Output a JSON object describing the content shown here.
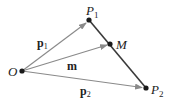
{
  "diagram": {
    "points": {
      "O": {
        "label": "O",
        "x": 22,
        "y": 71
      },
      "P1": {
        "label": "P",
        "sub": "1",
        "x": 89,
        "y": 20
      },
      "M": {
        "label": "M",
        "x": 110,
        "y": 44
      },
      "P2": {
        "label": "P",
        "sub": "2",
        "x": 146,
        "y": 88
      }
    },
    "vectors": [
      {
        "name": "p1",
        "label": "p",
        "sub": "1",
        "from": "O",
        "to": "P1"
      },
      {
        "name": "m",
        "label": "m",
        "from": "O",
        "to": "M"
      },
      {
        "name": "p2",
        "label": "p",
        "sub": "2",
        "from": "O",
        "to": "P2"
      }
    ],
    "segments": [
      {
        "from": "P1",
        "to": "P2"
      }
    ],
    "colors": {
      "vector": "#8a8a8a",
      "segment": "#3a3a3a",
      "point": "#1a1a1a",
      "text": "#222222"
    }
  }
}
